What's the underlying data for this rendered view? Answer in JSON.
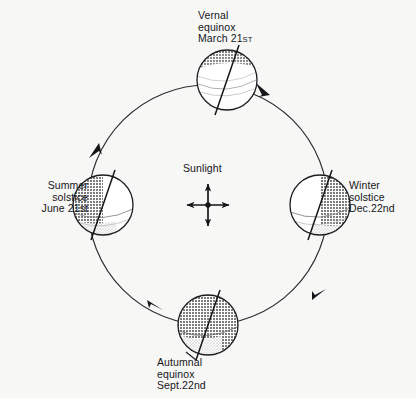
{
  "diagram": {
    "background_color": "#f7f7f6",
    "ink_color": "#15161a",
    "shade_color": "#8a8a8a",
    "orbit": {
      "center_x": 208,
      "center_y": 205,
      "radius": 120,
      "direction": "counterclockwise",
      "arrow_count": 4
    },
    "sun": {
      "label": "Sunlight",
      "icon": "four-way-arrow-cross",
      "x": 208,
      "y": 205
    },
    "positions": [
      {
        "id": "vernal",
        "name": "vernal-equinox-earth",
        "line1": "Vernal",
        "line2": "equinox",
        "line3_main": "March 21",
        "line3_suffix": "ST",
        "cx": 227,
        "cy": 80,
        "r": 30,
        "axis_tilt_deg": 23.5,
        "shaded_region": "north-polar-cap-band"
      },
      {
        "id": "summer",
        "name": "summer-solstice-earth",
        "line1": "Summer",
        "line2": "solstice",
        "line3_main": "June 21st",
        "line3_suffix": "",
        "cx": 103,
        "cy": 205,
        "r": 30,
        "axis_tilt_deg": 23.5,
        "shaded_region": "left-hemisphere-night"
      },
      {
        "id": "winter",
        "name": "winter-solstice-earth",
        "line1": "Winter",
        "line2": "solstice",
        "line3_main": "Dec.22nd",
        "line3_suffix": "",
        "cx": 320,
        "cy": 205,
        "r": 30,
        "axis_tilt_deg": 23.5,
        "shaded_region": "right-hemisphere-night"
      },
      {
        "id": "autumnal",
        "name": "autumnal-equinox-earth",
        "line1": "Autumnal",
        "line2": "equinox",
        "line3_main": "Sept.22nd",
        "line3_suffix": "",
        "cx": 208,
        "cy": 325,
        "r": 30,
        "axis_tilt_deg": 23.5,
        "shaded_region": "full-disc-night"
      }
    ]
  }
}
